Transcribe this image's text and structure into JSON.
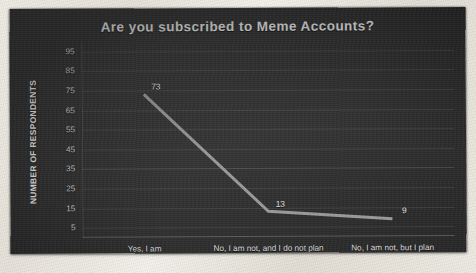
{
  "slide": {
    "title": "Are you subscribed to Meme Accounts?"
  },
  "chart_data": {
    "type": "line",
    "title": "Are you subscribed to Meme Accounts?",
    "xlabel": "",
    "ylabel": "NUMBER OF RESPONDENTS",
    "categories": [
      "Yes, I am",
      "No, I am not, and I do not plan",
      "No, I am not, but I plan"
    ],
    "values": [
      73,
      13,
      9
    ],
    "point_labels": [
      "73",
      "13",
      "9"
    ],
    "yticks": [
      95,
      85,
      75,
      65,
      55,
      45,
      35,
      25,
      15,
      5
    ],
    "ytick_labels": [
      "95",
      "85",
      "75",
      "65",
      "55",
      "45",
      "35",
      "25",
      "15",
      "5"
    ],
    "ylim": [
      0,
      100
    ],
    "grid": true,
    "legend": false,
    "series_color": "#9a9a9a",
    "background_color": "#303030",
    "text_color": "#ececec"
  }
}
